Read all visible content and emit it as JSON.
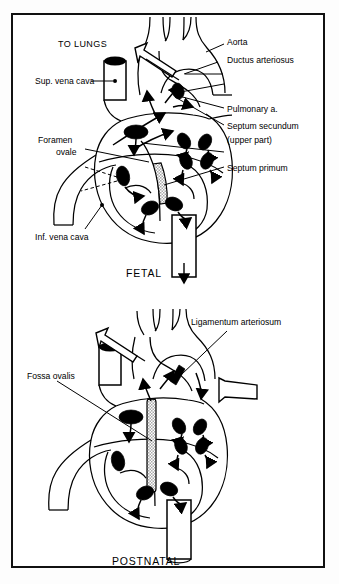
{
  "figure": {
    "frame_color": "#111111",
    "ink_color": "#000000",
    "background_color": "#ffffff",
    "septum_shade_color": "#b4b4b4"
  },
  "panels": [
    {
      "id": "fetal",
      "caption": "FETAL",
      "labels": [
        {
          "key": "to_lungs",
          "text": "TO LUNGS",
          "style": "uppercase"
        },
        {
          "key": "aorta",
          "text": "Aorta",
          "style": "normal"
        },
        {
          "key": "ductus_arteriosus",
          "text": "Ductus arteriosus",
          "style": "normal"
        },
        {
          "key": "sup_vena_cava",
          "text": "Sup. vena cava",
          "style": "normal"
        },
        {
          "key": "pulmonary_a",
          "text": "Pulmonary a.",
          "style": "normal"
        },
        {
          "key": "foramen",
          "text": "Foramen",
          "style": "normal"
        },
        {
          "key": "ovale",
          "text": "ovale",
          "style": "normal"
        },
        {
          "key": "septum_secundum",
          "text": "Septum secundum",
          "style": "normal"
        },
        {
          "key": "upper_part",
          "text": "(upper part)",
          "style": "normal"
        },
        {
          "key": "septum_primum",
          "text": "Septum primum",
          "style": "normal"
        },
        {
          "key": "inf_vena_cava",
          "text": "Inf. vena cava",
          "style": "normal"
        }
      ]
    },
    {
      "id": "postnatal",
      "caption": "POSTNATAL",
      "labels": [
        {
          "key": "ligamentum_arteriosum",
          "text": "Ligamentum arteriosum",
          "style": "normal"
        },
        {
          "key": "fossa_ovalis",
          "text": "Fossa ovalis",
          "style": "normal"
        }
      ]
    }
  ]
}
